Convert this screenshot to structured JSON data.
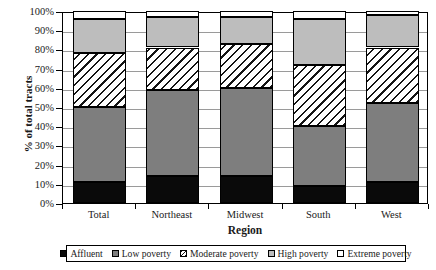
{
  "chart_data": {
    "type": "bar",
    "subtype": "stacked-bar-100",
    "title": "",
    "xlabel": "Region",
    "ylabel": "% of total tracts",
    "ylim": [
      0,
      100
    ],
    "yticks": [
      "0%",
      "10%",
      "20%",
      "30%",
      "40%",
      "50%",
      "60%",
      "70%",
      "80%",
      "90%",
      "100%"
    ],
    "ytick_values": [
      0,
      10,
      20,
      30,
      40,
      50,
      60,
      70,
      80,
      90,
      100
    ],
    "grid": true,
    "legend_position": "bottom",
    "categories": [
      "Total",
      "Northeast",
      "Midwest",
      "South",
      "West"
    ],
    "series": [
      {
        "name": "Affluent",
        "key": "affluent",
        "color": "#0a0a0a",
        "pattern": "solid",
        "values": [
          11,
          14,
          14,
          9,
          11
        ]
      },
      {
        "name": "Low poverty",
        "key": "low",
        "color": "#7e7e7e",
        "pattern": "solid",
        "values": [
          39,
          45,
          46,
          31,
          41
        ]
      },
      {
        "name": "Moderate poverty",
        "key": "moderate",
        "color": "#ffffff",
        "pattern": "hatch",
        "values": [
          28,
          22,
          23,
          32,
          29
        ]
      },
      {
        "name": "High poverty",
        "key": "high",
        "color": "#bdbdbd",
        "pattern": "solid",
        "values": [
          18,
          16,
          14,
          24,
          17
        ]
      },
      {
        "name": "Extreme poverty",
        "key": "extreme",
        "color": "#ffffff",
        "pattern": "solid",
        "values": [
          4,
          3,
          3,
          4,
          2
        ]
      }
    ],
    "cumulative_tops": {
      "Total": {
        "affluent": 11,
        "low": 50,
        "moderate": 78,
        "high": 96,
        "extreme": 100
      },
      "Northeast": {
        "affluent": 14,
        "low": 59,
        "moderate": 81,
        "high": 97,
        "extreme": 100
      },
      "Midwest": {
        "affluent": 14,
        "low": 60,
        "moderate": 83,
        "high": 97,
        "extreme": 100
      },
      "South": {
        "affluent": 9,
        "low": 40,
        "moderate": 72,
        "high": 96,
        "extreme": 100
      },
      "West": {
        "affluent": 11,
        "low": 52,
        "moderate": 81,
        "high": 98,
        "extreme": 100
      }
    }
  }
}
